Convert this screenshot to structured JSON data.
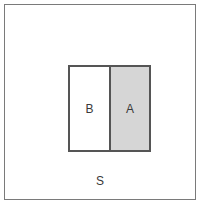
{
  "figure": {
    "type": "set-diagram",
    "background_color": "#ffffff"
  },
  "universe": {
    "label": "S",
    "fill_color": "#ffffff",
    "border_color": "#7a7a7a"
  },
  "inner": {
    "border_color": "#555555",
    "divider_color": "#555555"
  },
  "regions": [
    {
      "id": "b",
      "label": "B",
      "fill_color": "#ffffff",
      "shaded": "false"
    },
    {
      "id": "a",
      "label": "A",
      "fill_color": "#d6d6d6",
      "shaded": "true"
    }
  ]
}
